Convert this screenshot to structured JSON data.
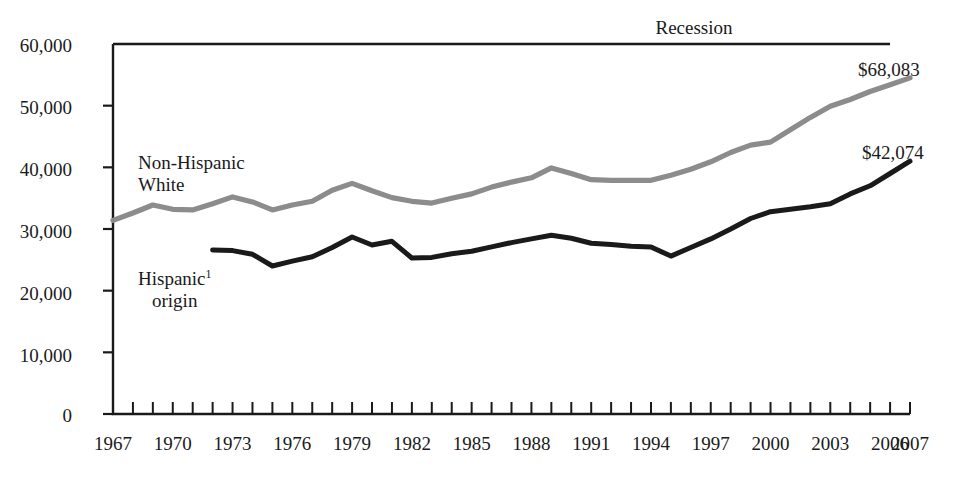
{
  "chart_data": {
    "type": "line",
    "title": "",
    "subtitle": "",
    "xlabel": "",
    "ylabel": "",
    "xlim": [
      1967,
      2007
    ],
    "ylim": [
      0,
      60000
    ],
    "grid": false,
    "legend_position": "inline-annotations",
    "x_tick_labels": [
      "1967",
      "1970",
      "1973",
      "1976",
      "1979",
      "1982",
      "1985",
      "1988",
      "1991",
      "1994",
      "1997",
      "2000",
      "2003",
      "2006",
      "2007"
    ],
    "x_tick_values": [
      1967,
      1970,
      1973,
      1976,
      1979,
      1982,
      1985,
      1988,
      1991,
      1994,
      1997,
      2000,
      2003,
      2006,
      2007
    ],
    "y_tick_labels": [
      "0",
      "10,000",
      "20,000",
      "30,000",
      "40,000",
      "50,000",
      "60,000"
    ],
    "y_tick_values": [
      0,
      10000,
      20000,
      30000,
      40000,
      50000,
      60000
    ],
    "series": [
      {
        "name": "Non-Hispanic White",
        "color": "#8c8c8c",
        "label_line1": "Non-Hispanic",
        "label_line2": "White",
        "end_label": "$68,083",
        "x": [
          1967,
          1968,
          1969,
          1970,
          1971,
          1972,
          1973,
          1974,
          1975,
          1976,
          1977,
          1978,
          1979,
          1980,
          1981,
          1982,
          1983,
          1984,
          1985,
          1986,
          1987,
          1988,
          1989,
          1990,
          1991,
          1992,
          1993,
          1994,
          1995,
          1996,
          1997,
          1998,
          1999,
          2000,
          2001,
          2002,
          2003,
          2004,
          2005,
          2006,
          2007
        ],
        "values": [
          31400,
          32600,
          33900,
          33200,
          33100,
          34100,
          35200,
          34400,
          33100,
          33900,
          34500,
          36300,
          37400,
          36200,
          35100,
          34500,
          34200,
          35000,
          35700,
          36800,
          37600,
          38300,
          39900,
          39000,
          38000,
          37900,
          37900,
          37900,
          38700,
          39700,
          40900,
          42400,
          43600,
          44100,
          46100,
          48100,
          49900,
          51000,
          52300,
          53400,
          54500
        ]
      },
      {
        "name": "Hispanic origin",
        "color": "#1a1a1a",
        "label_line1": "Hispanic",
        "label_line1_sup": "1",
        "label_line2": "origin",
        "end_label": "$42,074",
        "x": [
          1972,
          1973,
          1974,
          1975,
          1976,
          1977,
          1978,
          1979,
          1980,
          1981,
          1982,
          1983,
          1984,
          1985,
          1986,
          1987,
          1988,
          1989,
          1990,
          1991,
          1992,
          1993,
          1994,
          1995,
          1996,
          1997,
          1998,
          1999,
          2000,
          2001,
          2002,
          2003,
          2004,
          2005,
          2006,
          2007
        ],
        "values": [
          26600,
          26500,
          25900,
          24000,
          24800,
          25500,
          27000,
          28700,
          27400,
          28000,
          25300,
          25400,
          26000,
          26400,
          27100,
          27800,
          28400,
          29000,
          28500,
          27700,
          27500,
          27200,
          27100,
          25600,
          27000,
          28400,
          30000,
          31700,
          32800,
          33200,
          33600,
          34100,
          35700,
          37000,
          39000,
          41000
        ]
      }
    ],
    "annotations": [
      {
        "name": "recession-bar",
        "label": "Recession",
        "x_start": 1967,
        "x_end": 2006,
        "y": 60000
      }
    ]
  }
}
